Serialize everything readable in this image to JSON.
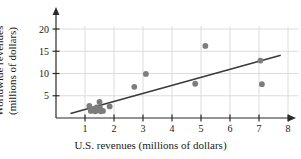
{
  "chart_data": {
    "type": "scatter",
    "title": "",
    "xlabel": "U.S. revenues (millions of dollars)",
    "ylabel_line1": "Worldwide revenues",
    "ylabel_line2": "(millions of dollars)",
    "xlim": [
      0,
      8.7
    ],
    "ylim": [
      0,
      21.5
    ],
    "xticks": [
      1,
      2,
      3,
      4,
      5,
      6,
      7,
      8
    ],
    "yticks": [
      5,
      10,
      15,
      20
    ],
    "xtick_labels": [
      "1",
      "2",
      "3",
      "4",
      "5",
      "6",
      "7",
      "8"
    ],
    "ytick_labels": [
      "5",
      "10",
      "15",
      "20"
    ],
    "grid": true,
    "legend": "none",
    "marker_color": "#7d7d7d",
    "line_color": "#3a3a3a",
    "grid_color": "#dcdcdc",
    "axis_color": "#2b2b2b",
    "points": [
      {
        "x": 1.15,
        "y": 2.7
      },
      {
        "x": 1.2,
        "y": 1.6
      },
      {
        "x": 1.3,
        "y": 2.0
      },
      {
        "x": 1.35,
        "y": 1.5
      },
      {
        "x": 1.4,
        "y": 2.4
      },
      {
        "x": 1.45,
        "y": 1.7
      },
      {
        "x": 1.5,
        "y": 3.6
      },
      {
        "x": 1.52,
        "y": 2.2
      },
      {
        "x": 1.55,
        "y": 1.5
      },
      {
        "x": 1.62,
        "y": 1.6
      },
      {
        "x": 1.85,
        "y": 2.6
      },
      {
        "x": 2.7,
        "y": 7.0
      },
      {
        "x": 3.1,
        "y": 9.9
      },
      {
        "x": 4.8,
        "y": 7.7
      },
      {
        "x": 5.15,
        "y": 16.2
      },
      {
        "x": 7.05,
        "y": 12.9
      },
      {
        "x": 7.1,
        "y": 7.6
      }
    ],
    "trend_line": {
      "x_start": 0.5,
      "y_start": 1.0,
      "x_end": 7.75,
      "y_end": 14.1
    }
  }
}
